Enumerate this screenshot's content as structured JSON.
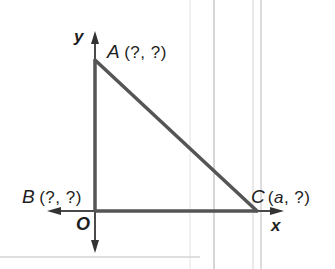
{
  "diagram": {
    "type": "coordinate-plane-right-triangle",
    "colors": {
      "line": "#4a4a4a",
      "text": "#1e1e1e",
      "background": "#ffffff",
      "faint_lines": "#d8d8d8"
    },
    "axes": {
      "x_label": "x",
      "y_label": "y",
      "origin_label": "O"
    },
    "points": [
      {
        "name": "A",
        "coords": "(?, ?)"
      },
      {
        "name": "B",
        "coords": "(?, ?)"
      },
      {
        "name": "C",
        "coords_var": "a",
        "coords_rest": ", ?)",
        "coords_open": "("
      }
    ],
    "segments": [
      "AB",
      "BC",
      "AC"
    ]
  }
}
